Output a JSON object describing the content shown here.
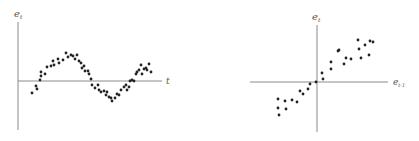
{
  "chart_data": [
    {
      "type": "scatter",
      "title": "",
      "xlabel": "t",
      "ylabel": "e_t",
      "ylabel_main": "e",
      "ylabel_sub": "t",
      "grid": false,
      "legend": null,
      "description": "Residuals over time showing a sinusoidal (positively autocorrelated) pattern",
      "points": [
        [
          32,
          93
        ],
        [
          36,
          86
        ],
        [
          37,
          89
        ],
        [
          40,
          80
        ],
        [
          41,
          76
        ],
        [
          41,
          72
        ],
        [
          45,
          74
        ],
        [
          47,
          67
        ],
        [
          51,
          66
        ],
        [
          53,
          61
        ],
        [
          54,
          65
        ],
        [
          58,
          59
        ],
        [
          59,
          63
        ],
        [
          63,
          60
        ],
        [
          66,
          53
        ],
        [
          68,
          57
        ],
        [
          71,
          55
        ],
        [
          73,
          56
        ],
        [
          75,
          59
        ],
        [
          77,
          55
        ],
        [
          79,
          61
        ],
        [
          81,
          63
        ],
        [
          82,
          68
        ],
        [
          84,
          66
        ],
        [
          85,
          71
        ],
        [
          88,
          71
        ],
        [
          89,
          74
        ],
        [
          91,
          79
        ],
        [
          92,
          85
        ],
        [
          95,
          88
        ],
        [
          98,
          85
        ],
        [
          99,
          90
        ],
        [
          101,
          92
        ],
        [
          104,
          91
        ],
        [
          106,
          95
        ],
        [
          107,
          92
        ],
        [
          109,
          97
        ],
        [
          111,
          98
        ],
        [
          112,
          101
        ],
        [
          115,
          98
        ],
        [
          117,
          94
        ],
        [
          119,
          95
        ],
        [
          121,
          90
        ],
        [
          124,
          87
        ],
        [
          126,
          85
        ],
        [
          127,
          90
        ],
        [
          129,
          87
        ],
        [
          130,
          81
        ],
        [
          132,
          80
        ],
        [
          134,
          81
        ],
        [
          136,
          74
        ],
        [
          137,
          72
        ],
        [
          139,
          70
        ],
        [
          141,
          65
        ],
        [
          142,
          74
        ],
        [
          144,
          69
        ],
        [
          146,
          68
        ],
        [
          147,
          70
        ],
        [
          149,
          64
        ],
        [
          151,
          72
        ]
      ],
      "axes_px": {
        "origin": [
          18,
          81
        ],
        "x_end": 162,
        "y_top": 22,
        "y_bottom": 130
      }
    },
    {
      "type": "scatter",
      "title": "",
      "xlabel": "e_{t-1}",
      "xlabel_main": "e",
      "xlabel_sub": "t-1",
      "ylabel": "e_t",
      "ylabel_main": "e",
      "ylabel_sub": "t",
      "grid": false,
      "legend": null,
      "description": "Lag plot of residuals showing strong positive linear relationship between e_t and e_{t-1}",
      "points": [
        [
          278,
          99
        ],
        [
          278,
          108
        ],
        [
          279,
          115
        ],
        [
          285,
          101
        ],
        [
          286,
          109
        ],
        [
          292,
          100
        ],
        [
          297,
          102
        ],
        [
          300,
          91
        ],
        [
          303,
          94
        ],
        [
          308,
          89
        ],
        [
          310,
          84
        ],
        [
          316,
          82
        ],
        [
          322,
          73
        ],
        [
          323,
          79
        ],
        [
          331,
          69
        ],
        [
          331,
          62
        ],
        [
          338,
          51
        ],
        [
          339,
          50
        ],
        [
          344,
          64
        ],
        [
          346,
          58
        ],
        [
          351,
          59
        ],
        [
          358,
          40
        ],
        [
          359,
          49
        ],
        [
          361,
          58
        ],
        [
          365,
          45
        ],
        [
          369,
          55
        ],
        [
          370,
          41
        ],
        [
          373,
          42
        ]
      ],
      "axes_px": {
        "origin": [
          317,
          82
        ],
        "x_start": 250,
        "x_end": 388,
        "y_top": 25,
        "y_bottom": 132
      }
    }
  ],
  "labels": {
    "left_y_main": "e",
    "left_y_sub": "t",
    "left_x": "t",
    "right_y_main": "e",
    "right_y_sub": "t",
    "right_x_main": "e",
    "right_x_sub": "t-1"
  },
  "colors": {
    "axis": "#8a8a8a",
    "dot": "#222222",
    "label": "#555555",
    "background": "#ffffff"
  }
}
